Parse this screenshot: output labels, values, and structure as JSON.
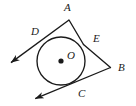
{
  "figure": {
    "type": "geometry-diagram",
    "width": 136,
    "height": 106,
    "background_color": "#ffffff",
    "stroke_color": "#1a1a1a",
    "label_color": "#1a1a1a"
  },
  "circle": {
    "center_label": "O",
    "center_x": 61,
    "center_y": 61,
    "radius": 24,
    "center_dot_radius": 2.6
  },
  "points": [
    {
      "label": "A",
      "x": 69,
      "y": 20,
      "label_x": 64,
      "label_y": 2,
      "kind": "external-vertex"
    },
    {
      "label": "B",
      "x": 110,
      "y": 67,
      "label_x": 118,
      "label_y": 62,
      "kind": "external-vertex"
    },
    {
      "label": "C",
      "x": 72,
      "y": 85,
      "label_x": 78,
      "label_y": 88,
      "kind": "tangent-point"
    },
    {
      "label": "D",
      "x": 46,
      "y": 41,
      "label_x": 31,
      "label_y": 26,
      "kind": "tangent-point"
    },
    {
      "label": "E",
      "x": 83,
      "y": 44,
      "label_x": 93,
      "label_y": 33,
      "kind": "tangent-point"
    }
  ],
  "segments": [
    {
      "name": "ray-A-through-D",
      "from": "A",
      "through": "D",
      "to_x": 9,
      "to_y": 64,
      "arrow": true
    },
    {
      "name": "segment-A-to-E",
      "from": "A",
      "to": "E",
      "arrow": false
    },
    {
      "name": "segment-E-to-B",
      "from": "E",
      "to": "B",
      "arrow": false
    },
    {
      "name": "ray-B-through-C",
      "from": "B",
      "through": "C",
      "to_x": 33,
      "to_y": 100,
      "arrow": true
    }
  ],
  "arrowheads": [
    {
      "name": "arrowhead-lower-left-D-ray",
      "tip_x": 9,
      "tip_y": 64
    },
    {
      "name": "arrowhead-lower-left-C-ray",
      "tip_x": 33,
      "tip_y": 100
    }
  ],
  "labels": {
    "A": "A",
    "B": "B",
    "C": "C",
    "D": "D",
    "E": "E",
    "O": "O"
  }
}
